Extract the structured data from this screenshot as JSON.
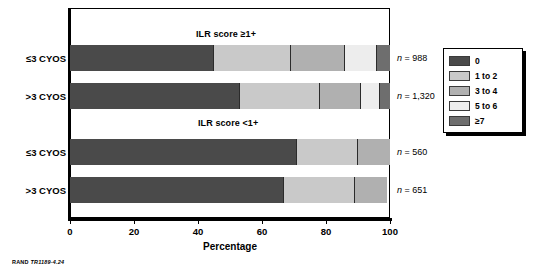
{
  "chart_data": {
    "type": "bar",
    "title": "",
    "xlabel": "Percentage",
    "ylabel": "",
    "xlim": [
      0,
      100
    ],
    "grid": false,
    "orientation": "horizontal",
    "stacked": true,
    "legend_position": "right",
    "xticks": [
      0,
      20,
      40,
      60,
      80,
      100
    ],
    "xticklabels": [
      "0",
      "20",
      "40",
      "60",
      "80",
      "100"
    ],
    "legend": [
      "0",
      "1 to 2",
      "3 to 4",
      "5 to 6",
      "≥7"
    ],
    "colors": [
      "#4a4a4a",
      "#c9c9c9",
      "#b0b0b0",
      "#ededed",
      "#6e6e6e"
    ],
    "groups": [
      {
        "title": "ILR score ≥1+",
        "bars": [
          {
            "category": "≤3 CYOS",
            "n_label": "n = 988",
            "values": [
              45,
              24,
              17,
              10,
              4
            ]
          },
          {
            "category": ">3 CYOS",
            "n_label": "n = 1,320",
            "values": [
              53,
              25,
              13,
              6,
              3
            ]
          }
        ]
      },
      {
        "title": "ILR score <1+",
        "bars": [
          {
            "category": "≤3 CYOS",
            "n_label": "n = 560",
            "values": [
              71,
              19,
              10,
              0,
              0
            ]
          },
          {
            "category": ">3 CYOS",
            "n_label": "n = 651",
            "values": [
              67,
              22,
              10,
              0,
              0
            ]
          }
        ]
      }
    ]
  },
  "source_note": {
    "prefix": "RAND ",
    "id": "TR1189-4.24"
  }
}
